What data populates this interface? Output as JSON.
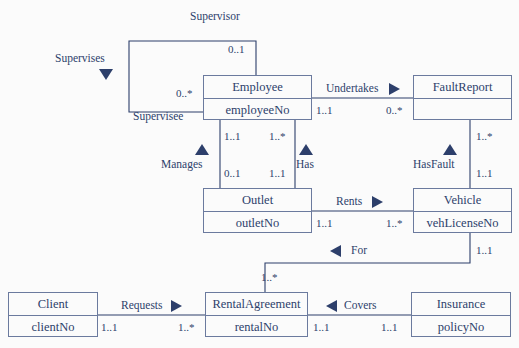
{
  "diagram": {
    "colors": {
      "text": "#2d3f6b",
      "border": "#6b7a9e",
      "marker": "#2d3f6b",
      "background": "#fbfbfb"
    }
  },
  "classes": [
    {
      "id": "employee",
      "name": "Employee",
      "attribute": "employeeNo"
    },
    {
      "id": "faultreport",
      "name": "FaultReport",
      "attribute": ""
    },
    {
      "id": "outlet",
      "name": "Outlet",
      "attribute": "outletNo"
    },
    {
      "id": "vehicle",
      "name": "Vehicle",
      "attribute": "vehLicenseNo"
    },
    {
      "id": "client",
      "name": "Client",
      "attribute": "clientNo"
    },
    {
      "id": "rentalagreement",
      "name": "RentalAgreement",
      "attribute": "rentalNo"
    },
    {
      "id": "insurance",
      "name": "Insurance",
      "attribute": "policyNo"
    }
  ],
  "associations": [
    {
      "id": "supervises",
      "label": "Supervises",
      "direction": "down",
      "roles": {
        "source": "Supervisor",
        "target": "Supervisee"
      },
      "multiplicity": {
        "source": "0..1",
        "target": "0..*"
      }
    },
    {
      "id": "undertakes",
      "label": "Undertakes",
      "direction": "right",
      "multiplicity": {
        "source": "1..1",
        "target": "0..*"
      }
    },
    {
      "id": "manages",
      "label": "Manages",
      "direction": "up",
      "multiplicity": {
        "source": "1..1",
        "target": "0..1"
      }
    },
    {
      "id": "has",
      "label": "Has",
      "direction": "up",
      "multiplicity": {
        "source": "1..*",
        "target": "1..1"
      }
    },
    {
      "id": "hasfault",
      "label": "HasFault",
      "direction": "up",
      "multiplicity": {
        "source": "1..*",
        "target": "1..1"
      }
    },
    {
      "id": "rents",
      "label": "Rents",
      "direction": "right",
      "multiplicity": {
        "source": "1..1",
        "target": "1..*"
      }
    },
    {
      "id": "for",
      "label": "For",
      "direction": "left",
      "multiplicity": {
        "source": "1..1",
        "target": "1..*"
      }
    },
    {
      "id": "requests",
      "label": "Requests",
      "direction": "right",
      "multiplicity": {
        "source": "1..1",
        "target": "1..*"
      }
    },
    {
      "id": "covers",
      "label": "Covers",
      "direction": "left",
      "multiplicity": {
        "source": "1..1",
        "target": "1..1"
      }
    }
  ]
}
